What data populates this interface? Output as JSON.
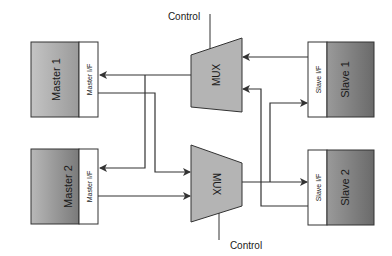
{
  "diagram": {
    "masters": [
      {
        "name": "Master 1",
        "interface": "Master I/F"
      },
      {
        "name": "Master 2",
        "interface": "Master I/F"
      }
    ],
    "slaves": [
      {
        "name": "Slave 1",
        "interface": "Slave I/F"
      },
      {
        "name": "Slave 2",
        "interface": "Slave I/F"
      }
    ],
    "muxes": [
      {
        "label": "MUX",
        "control_label": "Control"
      },
      {
        "label": "MUX",
        "control_label": "Control"
      }
    ],
    "colors": {
      "block_dark": "#6e6e6e",
      "block_light": "#c8c8c8",
      "mux_fill": "#b4b4b4",
      "line": "#333333"
    }
  }
}
